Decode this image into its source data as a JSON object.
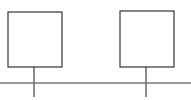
{
  "diagram": {
    "type": "bus-topology",
    "colors": {
      "box_stroke": "#333333",
      "bus_stroke": "#777777",
      "drop_stroke": "#666666",
      "background": "#ffffff"
    },
    "nodes": [
      {
        "id": "node-1",
        "x": 8,
        "y": 12,
        "w": 54,
        "h": 55,
        "drop_x": 34
      },
      {
        "id": "node-2",
        "x": 120,
        "y": 11,
        "w": 54,
        "h": 56,
        "drop_x": 146
      }
    ],
    "bus": {
      "y": 83,
      "x1": 0,
      "x2": 191
    },
    "drop_bottom": 97
  }
}
